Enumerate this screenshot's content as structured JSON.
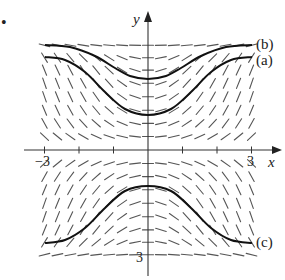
{
  "figure": {
    "bullet": "•",
    "axes": {
      "x_label": "x",
      "y_label": "y",
      "x_ticks": [
        -3,
        -2,
        -1,
        1,
        2,
        3
      ],
      "x_tick_labels": {
        "neg": "−3",
        "pos": "3"
      },
      "y_tick_labels": {
        "neg": "3"
      },
      "xlim": [
        -3,
        3
      ],
      "ylim": [
        -3,
        3
      ]
    },
    "slope_field": {
      "description": "Direction field with zero slope along y = 0 and y = ±3; negative slopes upper-left / lower-right, positive slopes upper-right / lower-left",
      "x_values": [
        -3,
        -2.625,
        -2.25,
        -1.875,
        -1.5,
        -1.125,
        -0.75,
        -0.375,
        0,
        0.375,
        0.75,
        1.125,
        1.5,
        1.875,
        2.25,
        2.625,
        3
      ],
      "y_values": [
        2.95,
        2.6,
        2.25,
        1.88,
        1.5,
        1.12,
        0.75,
        0.38,
        -0.38,
        -0.75,
        -1.12,
        -1.5,
        -1.88,
        -2.25,
        -2.6,
        -2.95
      ],
      "slope_formula": "k*x*y*(9-y^2)",
      "k": 0.09,
      "segment_length_px": 11,
      "color": "#555555"
    },
    "curves": [
      {
        "label": "(b)",
        "points_px": [
          [
            45,
            45
          ],
          [
            70,
            47
          ],
          [
            95,
            56
          ],
          [
            115,
            68
          ],
          [
            130,
            76
          ],
          [
            148,
            79
          ],
          [
            166,
            76
          ],
          [
            181,
            68
          ],
          [
            201,
            56
          ],
          [
            226,
            47
          ],
          [
            252,
            45
          ]
        ],
        "label_pos": [
          256,
          49
        ]
      },
      {
        "label": "(a)",
        "points_px": [
          [
            45,
            57
          ],
          [
            65,
            60
          ],
          [
            85,
            72
          ],
          [
            105,
            92
          ],
          [
            125,
            109
          ],
          [
            148,
            115
          ],
          [
            171,
            109
          ],
          [
            191,
            92
          ],
          [
            211,
            72
          ],
          [
            231,
            60
          ],
          [
            252,
            57
          ]
        ],
        "label_pos": [
          256,
          65
        ]
      },
      {
        "label": "(c)",
        "points_px": [
          [
            45,
            243
          ],
          [
            65,
            240
          ],
          [
            85,
            228
          ],
          [
            105,
            208
          ],
          [
            125,
            191
          ],
          [
            148,
            186
          ],
          [
            171,
            191
          ],
          [
            191,
            208
          ],
          [
            211,
            228
          ],
          [
            231,
            240
          ],
          [
            252,
            243
          ]
        ],
        "label_pos": [
          256,
          247
        ]
      }
    ],
    "colors": {
      "axis": "#333333",
      "curve": "#111111",
      "background": "#ffffff"
    }
  }
}
